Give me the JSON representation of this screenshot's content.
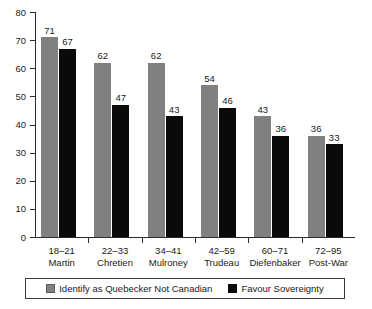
{
  "chart_data": {
    "type": "bar",
    "title": "",
    "xlabel": "",
    "ylabel": "",
    "ylim": [
      0,
      80
    ],
    "yticks": [
      0,
      10,
      20,
      30,
      40,
      50,
      60,
      70,
      80
    ],
    "grid": false,
    "legend_position": "bottom",
    "categories": [
      "18–21",
      "22–33",
      "34–41",
      "42–59",
      "60–71",
      "72–95"
    ],
    "category_names": [
      "Martin",
      "Chretien",
      "Mulroney",
      "Trudeau",
      "Diefenbaker",
      "Post-War"
    ],
    "series": [
      {
        "name": "Identify as Quebecker Not Canadian",
        "color": "#808080",
        "values": [
          71,
          62,
          62,
          54,
          43,
          36
        ]
      },
      {
        "name": "Favour Sovereignty",
        "color": "#0a0a0a",
        "values": [
          67,
          47,
          43,
          46,
          36,
          33
        ]
      }
    ]
  },
  "legend": {
    "entries": [
      {
        "label": "Identify as Quebecker Not Canadian",
        "color": "#808080"
      },
      {
        "label": "Favour Sovereignty",
        "color": "#0a0a0a"
      }
    ]
  }
}
